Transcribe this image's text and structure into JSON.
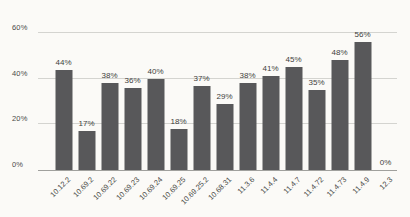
{
  "chart_data": {
    "type": "bar",
    "title": "",
    "xlabel": "",
    "ylabel": "",
    "categories": [
      "10.12.2",
      "10.69.2",
      "10.69.22",
      "10.69.23",
      "10.69.24",
      "10.69.25",
      "10.69.25.2",
      "10.68.31",
      "11.3.6",
      "11.4.4",
      "11.4.7",
      "11.4.72",
      "11.4.73",
      "11.4.9",
      "12.3"
    ],
    "values": [
      44,
      17,
      38,
      36,
      40,
      18,
      37,
      29,
      38,
      41,
      45,
      35,
      48,
      56,
      0
    ],
    "value_labels": [
      "44%",
      "17%",
      "38%",
      "36%",
      "40%",
      "18%",
      "37%",
      "29%",
      "38%",
      "41%",
      "45%",
      "35%",
      "48%",
      "56%",
      "0%"
    ],
    "ylim": [
      0,
      60
    ],
    "yticks": [
      {
        "value": 0,
        "label": "0%"
      },
      {
        "value": 20,
        "label": "20%"
      },
      {
        "value": 40,
        "label": "40%"
      },
      {
        "value": 60,
        "label": "60%"
      }
    ],
    "grid": true,
    "legend": false,
    "colors": {
      "bar": "#58585a",
      "gridline": "#d4d4d0",
      "baseline": "#a0a09d",
      "text": "#4a4a48",
      "background": "#fbfaf7"
    }
  }
}
